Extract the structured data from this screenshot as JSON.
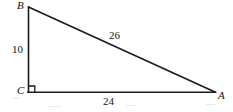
{
  "figure": {
    "kind": "right-triangle-diagram",
    "stroke_color": "#1a1a1a",
    "background_color": "#ffffff",
    "vertices": [
      {
        "id": "B",
        "label": "B",
        "x": 28,
        "y": 7
      },
      {
        "id": "C",
        "label": "C",
        "x": 28,
        "y": 92
      },
      {
        "id": "A",
        "label": "A",
        "x": 215,
        "y": 92
      }
    ],
    "sides": [
      {
        "id": "BC",
        "label": "10",
        "from": "B",
        "to": "C",
        "role": "vertical-leg"
      },
      {
        "id": "BA",
        "label": "26",
        "from": "B",
        "to": "A",
        "role": "hypotenuse"
      },
      {
        "id": "CA",
        "label": "24",
        "from": "C",
        "to": "A",
        "role": "horizontal-leg"
      }
    ],
    "right_angle": {
      "at_vertex": "C",
      "marker": "square",
      "size": 6
    }
  }
}
